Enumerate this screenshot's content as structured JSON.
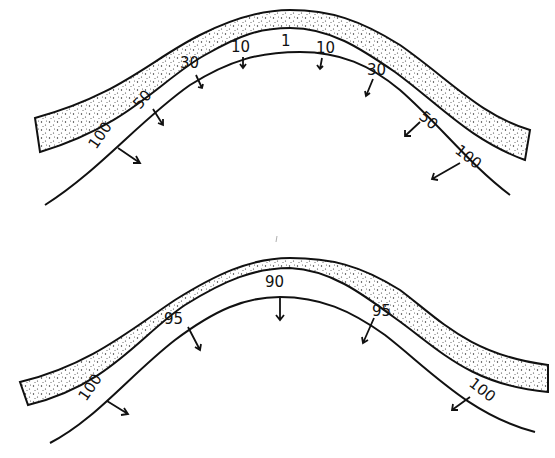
{
  "diagrams": [
    {
      "id": "top",
      "description": "Fold with overlying stippled layer; vectors show values increasing from crest to limbs",
      "labels": [
        {
          "text": "100",
          "x": 96,
          "y": 150,
          "rot": -55
        },
        {
          "text": "50",
          "x": 140,
          "y": 110,
          "rot": -50
        },
        {
          "text": "30",
          "x": 180,
          "y": 68,
          "rot": 0
        },
        {
          "text": "10",
          "x": 231,
          "y": 52,
          "rot": 0
        },
        {
          "text": "1",
          "x": 281,
          "y": 46,
          "rot": 0
        },
        {
          "text": "10",
          "x": 316,
          "y": 53,
          "rot": 0
        },
        {
          "text": "30",
          "x": 367,
          "y": 75,
          "rot": 0
        },
        {
          "text": "50",
          "x": 418,
          "y": 118,
          "rot": 40
        },
        {
          "text": "100",
          "x": 454,
          "y": 152,
          "rot": 38
        }
      ]
    },
    {
      "id": "bottom",
      "description": "Fold with overlying stippled layer; vectors show values 90 to 100",
      "labels": [
        {
          "text": "100",
          "x": 86,
          "y": 402,
          "rot": -55
        },
        {
          "text": "95",
          "x": 164,
          "y": 324,
          "rot": 0
        },
        {
          "text": "90",
          "x": 265,
          "y": 287,
          "rot": 0
        },
        {
          "text": "95",
          "x": 372,
          "y": 316,
          "rot": 0
        },
        {
          "text": "100",
          "x": 468,
          "y": 385,
          "rot": 38
        }
      ]
    }
  ],
  "colors": {
    "ink": "#111111",
    "background": "#ffffff"
  }
}
